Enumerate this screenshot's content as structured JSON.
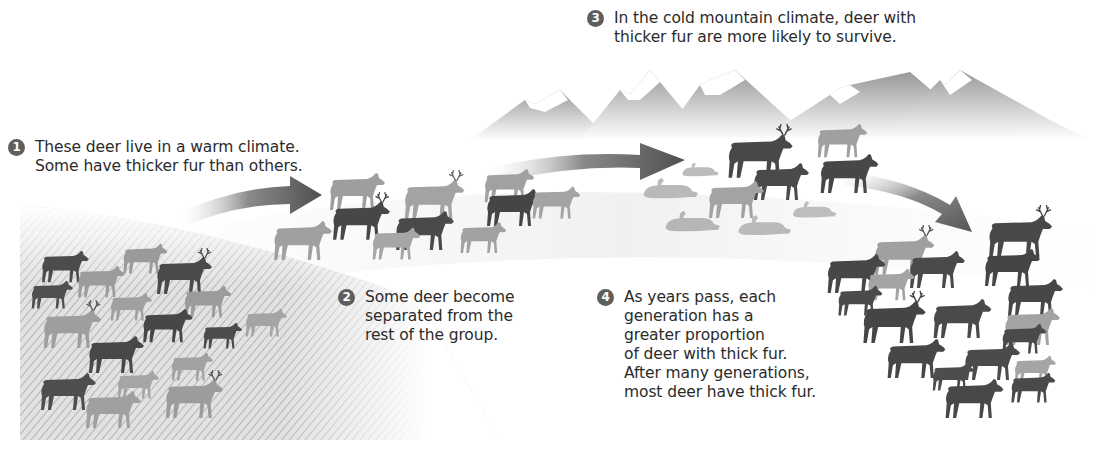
{
  "diagram": {
    "type": "natural-selection-process",
    "palette": {
      "thin_fur_deer": "#9a9a9a",
      "thick_fur_deer": "#4a4a4a",
      "dead_deer": "#b9b9b9",
      "arrow_dark": "#555555",
      "mountain": "#a8a8a8",
      "ground_hatch": "#c4c4c4",
      "text": "#2b2b2b"
    },
    "steps": [
      {
        "number": "1",
        "lines": [
          "These deer live in a warm climate.",
          "Some have thicker fur than others."
        ]
      },
      {
        "number": "2",
        "lines": [
          "Some deer become",
          "separated from the",
          "rest of the group."
        ]
      },
      {
        "number": "3",
        "lines": [
          "In the cold mountain climate, deer with",
          "thicker fur are more likely to survive."
        ]
      },
      {
        "number": "4",
        "lines": [
          "As years pass, each",
          "generation has a",
          "greater proportion",
          "of deer with thick fur.",
          "After many generations,",
          "most deer have thick fur."
        ]
      }
    ],
    "groups": [
      {
        "name": "warm-climate-herd",
        "thick_fur": 8,
        "thin_fur": 12
      },
      {
        "name": "separated-group",
        "thick_fur": 3,
        "thin_fur": 7
      },
      {
        "name": "mountain-survivors",
        "thick_fur": 3,
        "thin_fur": 2,
        "dead": 6
      },
      {
        "name": "later-generations",
        "thick_fur": 16,
        "thin_fur": 4
      }
    ],
    "arrows": 3
  }
}
